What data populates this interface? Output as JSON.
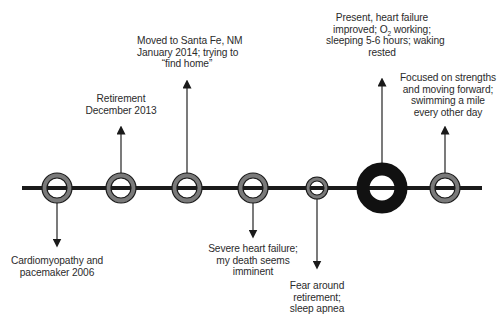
{
  "diagram": {
    "type": "timeline",
    "colors": {
      "line": "#1a1a1a",
      "ring_fill": "#7a7a7a",
      "ring_stroke": "#1a1a1a",
      "present_ring": "#111111",
      "text": "#2b2b2b"
    },
    "events": [
      {
        "id": "cardiomyopathy",
        "direction": "down",
        "size": "normal",
        "lines": [
          "Cardiomyopathy and",
          "pacemaker 2006"
        ]
      },
      {
        "id": "retirement",
        "direction": "up",
        "size": "normal",
        "lines": [
          "Retirement",
          "December 2013"
        ]
      },
      {
        "id": "moved-santa-fe",
        "direction": "up",
        "size": "normal",
        "lines": [
          "Moved to Santa Fe, NM",
          "January 2014; trying to",
          "“find home”"
        ]
      },
      {
        "id": "severe-heart-failure",
        "direction": "down",
        "size": "normal",
        "lines": [
          "Severe heart failure;",
          "my death seems",
          "imminent"
        ]
      },
      {
        "id": "fear-retirement",
        "direction": "down",
        "size": "small",
        "lines": [
          "Fear around",
          "retirement;",
          "sleep apnea"
        ]
      },
      {
        "id": "present",
        "direction": "up",
        "size": "large",
        "lines": [
          "Present, heart failure",
          "improved; O",
          "sleeping 5-6 hours; waking",
          "rested"
        ],
        "o2_subscript": "2",
        "o2_suffix": " working;"
      },
      {
        "id": "focused-strengths",
        "direction": "up",
        "size": "normal",
        "lines": [
          "Focused on strengths",
          "and moving forward;",
          "swimming a mile",
          "every other day"
        ]
      }
    ]
  }
}
